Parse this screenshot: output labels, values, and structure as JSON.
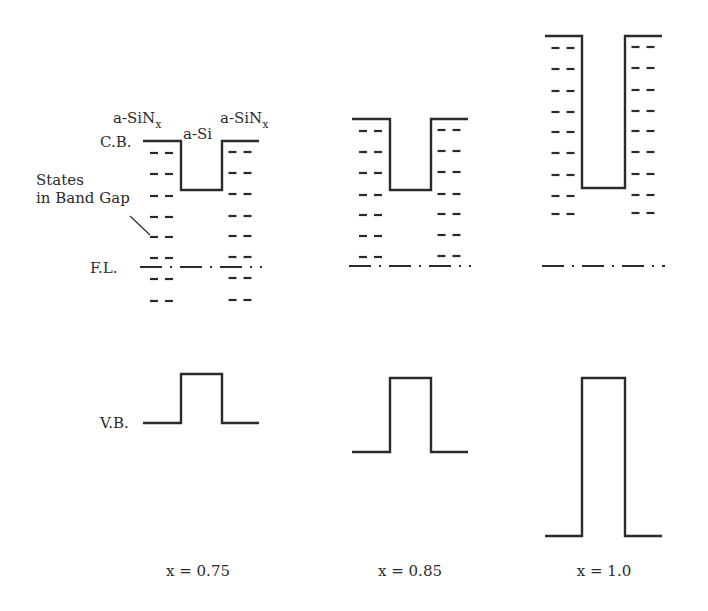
{
  "diagram": {
    "title": "",
    "labels": {
      "conduction_band": "C.B.",
      "valence_band": "V.B.",
      "fermi_level": "F.L.",
      "states_line1": "States",
      "states_line2": "in Band Gap",
      "left_layer": "a-SiN",
      "right_layer": "a-SiN",
      "layer_subscript": "x",
      "well_layer": "a-Si"
    },
    "panels": [
      {
        "id": "p1",
        "caption": "x = 0.75",
        "x0": 143,
        "x1": 181,
        "x2": 222,
        "x3": 259,
        "cb_outer": 141,
        "cb_inner": 190,
        "vb_outer": 423,
        "vb_inner": 374,
        "fl": 267,
        "dash_rows_left": [
          153,
          174,
          196,
          217,
          237,
          258,
          279,
          301
        ],
        "dash_rows_right": [
          152,
          173,
          194,
          216,
          236,
          257,
          278,
          300
        ]
      },
      {
        "id": "p2",
        "caption": "x = 0.85",
        "x0": 352,
        "x1": 390,
        "x2": 431,
        "x3": 468,
        "cb_outer": 119,
        "cb_inner": 190,
        "vb_outer": 452,
        "vb_inner": 378,
        "fl": 266,
        "dash_rows_left": [
          131,
          152,
          173,
          195,
          215,
          236,
          257
        ],
        "dash_rows_right": [
          130,
          151,
          172,
          194,
          214,
          235,
          256
        ]
      },
      {
        "id": "p3",
        "caption": "x = 1.0",
        "x0": 545,
        "x1": 582,
        "x2": 625,
        "x3": 662,
        "cb_outer": 36,
        "cb_inner": 188,
        "vb_outer": 536,
        "vb_inner": 378,
        "fl": 266,
        "dash_rows_left": [
          48,
          69,
          91,
          112,
          132,
          153,
          175,
          196,
          214
        ],
        "dash_rows_right": [
          47,
          68,
          90,
          111,
          131,
          152,
          174,
          195,
          213
        ]
      }
    ]
  }
}
